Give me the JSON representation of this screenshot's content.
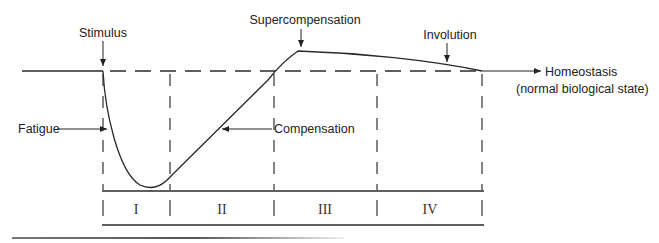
{
  "diagram": {
    "type": "supercompensation-cycle",
    "labels": {
      "stimulus": "Stimulus",
      "supercompensation": "Supercompensation",
      "involution": "Involution",
      "homeostasis_line1": "Homeostasis",
      "homeostasis_line2": "(normal biological state)",
      "fatigue": "Fatigue",
      "compensation": "Compensation"
    },
    "phases": [
      {
        "id": "I",
        "label": "I"
      },
      {
        "id": "II",
        "label": "II"
      },
      {
        "id": "III",
        "label": "III"
      },
      {
        "id": "IV",
        "label": "IV"
      }
    ],
    "colors": {
      "line": "#2a2a2a",
      "text": "#222222",
      "background": "#ffffff"
    }
  }
}
